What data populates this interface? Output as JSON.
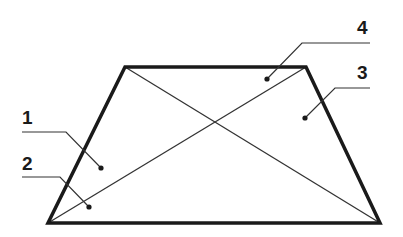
{
  "diagram": {
    "colors": {
      "outline": "#1a1a1a",
      "diagonal": "#333333",
      "leader": "#333333",
      "text": "#1a1a1a",
      "background": "#ffffff"
    },
    "trapezoid": {
      "top_left": [
        125,
        67
      ],
      "top_right": [
        306,
        67
      ],
      "bottom_right": [
        380,
        223
      ],
      "bottom_left": [
        48,
        223
      ]
    },
    "labels": [
      {
        "id": "1",
        "text": "1",
        "text_pos": [
          22,
          124
        ],
        "leader": [
          [
            22,
            132
          ],
          [
            66,
            132
          ],
          [
            101,
            168
          ]
        ],
        "dot": [
          101,
          168
        ]
      },
      {
        "id": "2",
        "text": "2",
        "text_pos": [
          22,
          170
        ],
        "leader": [
          [
            22,
            177
          ],
          [
            60,
            177
          ],
          [
            89,
            207
          ]
        ],
        "dot": [
          89,
          207
        ]
      },
      {
        "id": "3",
        "text": "3",
        "text_pos": [
          357,
          79
        ],
        "leader": [
          [
            370,
            88
          ],
          [
            335,
            88
          ],
          [
            305,
            118
          ]
        ],
        "dot": [
          305,
          118
        ]
      },
      {
        "id": "4",
        "text": "4",
        "text_pos": [
          357,
          34
        ],
        "leader": [
          [
            370,
            43
          ],
          [
            302,
            43
          ],
          [
            267,
            79
          ]
        ],
        "dot": [
          267,
          79
        ]
      }
    ]
  }
}
